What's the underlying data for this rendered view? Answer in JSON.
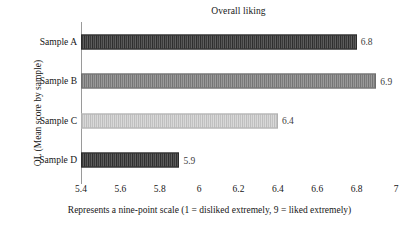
{
  "chart_data": {
    "type": "bar",
    "orientation": "horizontal",
    "title": "Overall liking",
    "xlabel": "Represents a nine-point scale (1 = disliked extremely, 9 = liked extremely)",
    "ylabel": "OL (Mean score by sample)",
    "categories": [
      "Sample A",
      "Sample B",
      "Sample C",
      "Sample D"
    ],
    "values": [
      6.8,
      6.9,
      6.4,
      5.9
    ],
    "value_labels": [
      "6.8",
      "6.9",
      "6.4",
      "5.9"
    ],
    "xlim": [
      5.4,
      7.0
    ],
    "xticks": [
      5.4,
      5.6,
      5.8,
      6.0,
      6.2,
      6.4,
      6.6,
      6.8,
      7.0
    ],
    "xtick_labels": [
      "5.4",
      "5.6",
      "5.8",
      "6",
      "6.2",
      "6.4",
      "6.6",
      "6.8",
      "7"
    ],
    "grid": false,
    "legend": false,
    "bar_styles": [
      "tex-dark",
      "tex-mid",
      "tex-light",
      "tex-dark"
    ],
    "bar_colors": [
      "#4a4a4a",
      "#8d8d8d",
      "#c9c9c9",
      "#4a4a4a"
    ]
  }
}
